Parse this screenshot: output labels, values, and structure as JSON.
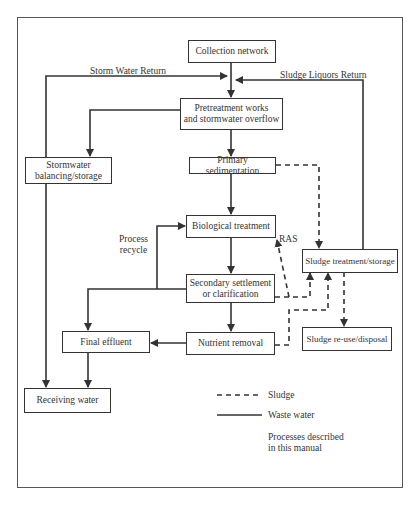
{
  "diagram": {
    "nodes": {
      "collection": "Collection network",
      "pretreatment": "Pretreatment works\nand stormwater overflow",
      "stormwater": "Stormwater\nbalancing/storage",
      "primary": "Primary sedimentation",
      "biological": "Biological treatment",
      "secondary": "Secondary settlement\nor clarification",
      "final_effluent": "Final effluent",
      "nutrient": "Nutrient removal",
      "receiving": "Receiving water",
      "sludge_treatment": "Sludge treatment/storage",
      "sludge_reuse": "Sludge re-use/disposal"
    },
    "labels": {
      "storm_return": "Storm Water Return",
      "sludge_return": "Sludge Liquors Return",
      "process_recycle": "Process\nrecycle",
      "ras": "RAS"
    },
    "legend": {
      "sludge": "Sludge",
      "waste_water": "Waste water",
      "processes": "Processes described\nin this manual"
    },
    "colors": {
      "line": "#333333",
      "frame": "#555555"
    }
  }
}
